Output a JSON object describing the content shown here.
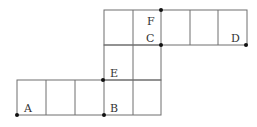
{
  "diagram": {
    "type": "grid-path-figure",
    "colors": {
      "line": "#6e6e6e",
      "dot": "#111111",
      "label": "#333333",
      "background": "#ffffff"
    },
    "cell_size_px": 29,
    "rows": [
      {
        "name": "bottom-row",
        "y_top": 80,
        "y_bottom": 115,
        "x_lines": [
          17,
          46,
          75,
          104,
          133,
          161
        ]
      },
      {
        "name": "middle-column",
        "y_top": 45,
        "y_bottom": 80,
        "x_lines": [
          104,
          133,
          161
        ]
      },
      {
        "name": "top-row",
        "y_top": 10,
        "y_bottom": 45,
        "x_lines": [
          104,
          133,
          161,
          190,
          218,
          247
        ]
      }
    ],
    "points": [
      {
        "id": "A",
        "label": "A",
        "dot": [
          17,
          115
        ],
        "text": [
          24,
          109
        ]
      },
      {
        "id": "B",
        "label": "B",
        "dot": [
          104,
          115
        ],
        "text": [
          110,
          109
        ]
      },
      {
        "id": "E",
        "label": "E",
        "dot": [
          103,
          80
        ],
        "text": [
          110,
          75
        ]
      },
      {
        "id": "C",
        "label": "C",
        "dot": [
          161,
          45
        ],
        "text": [
          146,
          41
        ]
      },
      {
        "id": "F",
        "label": "F",
        "dot": [
          161,
          10
        ],
        "text": [
          147,
          24
        ]
      },
      {
        "id": "D",
        "label": "D",
        "dot": [
          246,
          45
        ],
        "text": [
          231,
          41
        ]
      }
    ]
  }
}
